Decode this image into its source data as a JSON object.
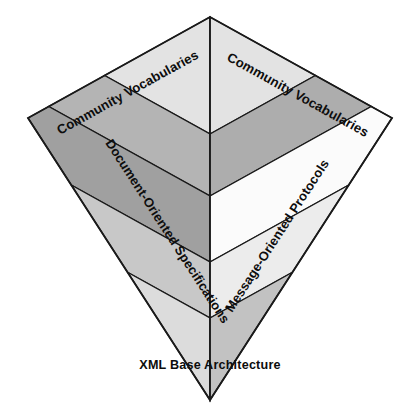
{
  "diagram": {
    "type": "layered-chevron-pyramid",
    "title": "XML Base Architecture",
    "background_color": "#ffffff",
    "outline_color": "#1a1a1a",
    "geometry": {
      "top_apex": [
        210,
        17
      ],
      "left_corner": [
        28,
        118
      ],
      "right_corner": [
        392,
        118
      ],
      "bottom_apex": [
        210,
        400
      ],
      "center_x": 210,
      "band_boundaries_y": [
        17,
        134,
        196,
        262,
        318,
        400
      ]
    },
    "panels": [
      {
        "id": "left-panel",
        "name": "Document-Oriented Specifications panel",
        "top_label": "Community Vocabularies",
        "diagonal_label": "Document-Oriented Specifications",
        "bands": [
          {
            "index": 0,
            "fill": "#e3e3e3"
          },
          {
            "index": 1,
            "fill": "#b4b4b4"
          },
          {
            "index": 2,
            "fill": "#a0a0a0"
          },
          {
            "index": 3,
            "fill": "#c8c8c8"
          },
          {
            "index": 4,
            "fill": "#dcdcdc"
          }
        ]
      },
      {
        "id": "right-panel",
        "name": "Message-Oriented Protocols panel",
        "top_label": "Community Vocabularies",
        "diagonal_label": "Message-Oriented Protocols",
        "bands": [
          {
            "index": 0,
            "fill": "#e3e3e3"
          },
          {
            "index": 1,
            "fill": "#adadad"
          },
          {
            "index": 2,
            "fill": "#fbfbfb"
          },
          {
            "index": 3,
            "fill": "#ececec"
          },
          {
            "index": 4,
            "fill": "#c2c2c2"
          }
        ]
      }
    ],
    "labels": {
      "top_left": "Community Vocabularies",
      "top_right": "Community Vocabularies",
      "diagonal_left": "Document-Oriented Specifications",
      "diagonal_right": "Message-Oriented Protocols",
      "base_caption": "XML Base Architecture"
    }
  }
}
